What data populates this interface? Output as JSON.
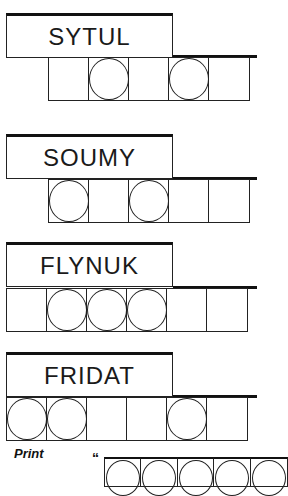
{
  "puzzles": [
    {
      "scrambled": "SYTUL",
      "cells": 5,
      "circled": [
        false,
        true,
        false,
        true,
        false
      ]
    },
    {
      "scrambled": "SOUMY",
      "cells": 5,
      "circled": [
        true,
        false,
        true,
        false,
        false
      ]
    },
    {
      "scrambled": "FLYNUK",
      "cells": 6,
      "circled": [
        false,
        true,
        true,
        true,
        false,
        false
      ]
    },
    {
      "scrambled": "FRIDAT",
      "cells": 6,
      "circled": [
        true,
        true,
        false,
        false,
        true,
        false
      ]
    }
  ],
  "footer": {
    "print_label": "Print",
    "quote_open": "“",
    "answer_cells_visible": 5
  }
}
